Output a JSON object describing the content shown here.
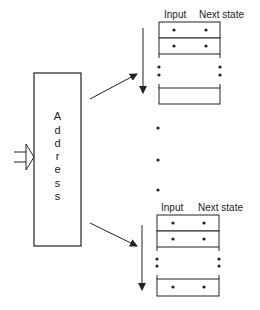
{
  "address_block": {
    "label_letters": [
      "A",
      "d",
      "d",
      "r",
      "e",
      "s",
      "s"
    ]
  },
  "memory_groups": [
    {
      "header": {
        "input": "Input",
        "next_state": "Next state"
      },
      "rows": 3
    },
    {
      "header": {
        "input": "Input",
        "next_state": "Next state"
      },
      "rows": 3
    }
  ],
  "colors": {
    "stroke": "#222222",
    "background": "#ffffff"
  }
}
